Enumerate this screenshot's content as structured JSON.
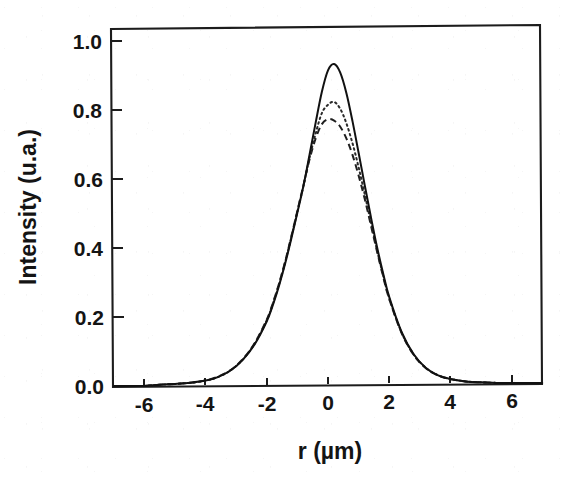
{
  "chart_data": {
    "type": "line",
    "title": "",
    "subtitle": "",
    "xlabel": "r  (µm)",
    "ylabel": "Intensity (u.a.)",
    "xlim": [
      -7.0,
      7.0
    ],
    "ylim": [
      -0.03,
      1.05
    ],
    "xticks": [
      -6,
      -4,
      -2,
      0,
      2,
      4,
      6
    ],
    "xticklabels": [
      "-6",
      "-4",
      "-2",
      "0",
      "2",
      "4",
      "6"
    ],
    "yticks": [
      0.0,
      0.2,
      0.4,
      0.6,
      0.8,
      1.0
    ],
    "yticklabels": [
      "0.0",
      "0.2",
      "0.4",
      "0.6",
      "0.8",
      "1.0"
    ],
    "grid": false,
    "legend": null,
    "frame": "box",
    "tick_direction": "out",
    "annotations": [],
    "x": [
      -7.0,
      -6.5,
      -6.0,
      -5.5,
      -5.0,
      -4.5,
      -4.0,
      -3.6,
      -3.2,
      -2.8,
      -2.4,
      -2.0,
      -1.8,
      -1.6,
      -1.4,
      -1.2,
      -1.0,
      -0.8,
      -0.6,
      -0.4,
      -0.2,
      0.0,
      0.2,
      0.4,
      0.6,
      0.8,
      1.0,
      1.2,
      1.4,
      1.6,
      1.8,
      2.0,
      2.4,
      2.8,
      3.2,
      3.6,
      4.0,
      4.5,
      5.0,
      5.5,
      6.0,
      6.5,
      7.0
    ],
    "series": [
      {
        "name": "solid",
        "linestyle": "solid",
        "peak": 0.93,
        "peak_position": 0.05,
        "values": [
          0.0,
          0.0,
          0.0,
          0.003,
          0.005,
          0.008,
          0.014,
          0.024,
          0.042,
          0.072,
          0.118,
          0.185,
          0.232,
          0.288,
          0.352,
          0.424,
          0.5,
          0.578,
          0.669,
          0.762,
          0.85,
          0.912,
          0.93,
          0.905,
          0.846,
          0.764,
          0.672,
          0.578,
          0.486,
          0.399,
          0.322,
          0.253,
          0.152,
          0.086,
          0.046,
          0.024,
          0.013,
          0.006,
          0.003,
          0.001,
          0.0,
          0.0,
          0.0
        ]
      },
      {
        "name": "dotted",
        "linestyle": "dotted",
        "peak": 0.82,
        "peak_position": 0.05,
        "values": [
          0.0,
          0.0,
          0.0,
          0.003,
          0.005,
          0.008,
          0.014,
          0.024,
          0.042,
          0.073,
          0.12,
          0.188,
          0.236,
          0.292,
          0.356,
          0.428,
          0.503,
          0.578,
          0.66,
          0.73,
          0.788,
          0.812,
          0.82,
          0.8,
          0.758,
          0.7,
          0.63,
          0.552,
          0.47,
          0.39,
          0.316,
          0.249,
          0.15,
          0.085,
          0.046,
          0.024,
          0.013,
          0.006,
          0.003,
          0.001,
          0.0,
          0.0,
          0.0
        ]
      },
      {
        "name": "dashed",
        "linestyle": "dashed",
        "peak": 0.77,
        "peak_position": 0.0,
        "values": [
          0.0,
          0.0,
          0.0,
          0.003,
          0.005,
          0.008,
          0.014,
          0.025,
          0.043,
          0.074,
          0.121,
          0.19,
          0.238,
          0.294,
          0.358,
          0.43,
          0.505,
          0.58,
          0.655,
          0.715,
          0.756,
          0.77,
          0.766,
          0.748,
          0.714,
          0.666,
          0.606,
          0.538,
          0.462,
          0.386,
          0.313,
          0.247,
          0.149,
          0.084,
          0.045,
          0.024,
          0.013,
          0.006,
          0.003,
          0.001,
          0.0,
          0.0,
          0.0
        ]
      }
    ]
  },
  "figure": {
    "axis_color": "#1c1c1c",
    "background": "#ffffff",
    "curve_color": "#111111"
  }
}
